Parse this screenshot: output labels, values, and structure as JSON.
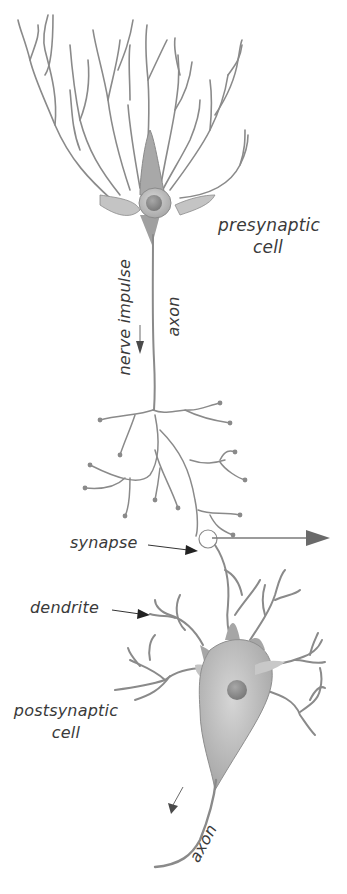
{
  "diagram": {
    "labels": {
      "presynaptic_line1": "presynaptic",
      "presynaptic_line2": "cell",
      "nerve_impulse": "nerve impulse",
      "axon_top": "axon",
      "synapse": "synapse",
      "dendrite": "dendrite",
      "postsynaptic_line1": "postsynaptic",
      "postsynaptic_line2": "cell",
      "axon_bottom": "axon"
    },
    "colors": {
      "neuron_stroke": "#8a8a8a",
      "soma_fill": "#b8b8b8",
      "nucleus_fill": "#8c8c8c",
      "text": "#3a3a3a",
      "arrow": "#6a6a6a",
      "background": "#ffffff"
    }
  }
}
